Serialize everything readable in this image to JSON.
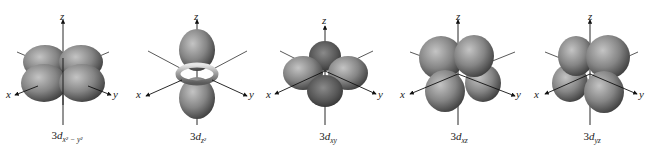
{
  "figure": {
    "colors": {
      "lobe_light": "#b8b8b8",
      "lobe_mid": "#7a7a7a",
      "lobe_dark": "#3a3a3a",
      "axis": "#111111",
      "background": "#ffffff"
    },
    "axis_labels": {
      "x": "x",
      "y": "y",
      "z": "z"
    },
    "orbitals": [
      {
        "id": "dx2-y2",
        "prefix": "3",
        "d": "d",
        "subscript": "x² − y²",
        "shape": "four lobes in xy-plane along axes"
      },
      {
        "id": "dz2",
        "prefix": "3",
        "d": "d",
        "subscript": "z²",
        "shape": "two lobes along z with torus"
      },
      {
        "id": "dxy",
        "prefix": "3",
        "d": "d",
        "subscript": "xy",
        "shape": "four lobes in xy-plane between axes"
      },
      {
        "id": "dxz",
        "prefix": "3",
        "d": "d",
        "subscript": "xz",
        "shape": "four lobes in xz-plane between axes"
      },
      {
        "id": "dyz",
        "prefix": "3",
        "d": "d",
        "subscript": "yz",
        "shape": "four lobes in yz-plane between axes"
      }
    ]
  }
}
